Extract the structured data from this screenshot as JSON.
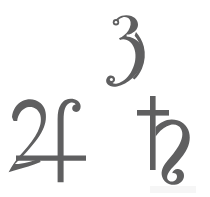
{
  "page": {
    "background_color": "#ffffff",
    "ink_color": "#5f5f60",
    "width": 210,
    "height": 197,
    "medium": "scanned print"
  },
  "symbols": [
    {
      "id": "three",
      "name": "numeral-three",
      "label": "3",
      "unicode": "3",
      "meaning": "numeral three",
      "position": {
        "x": 102,
        "y": 14,
        "width": 46,
        "height": 74
      },
      "color": "#5f5f60"
    },
    {
      "id": "jupiter",
      "name": "jupiter-symbol",
      "label": "♃",
      "unicode": "U+2643",
      "meaning": "Jupiter",
      "position": {
        "x": 8,
        "y": 98,
        "width": 84,
        "height": 86
      },
      "color": "#5f5f60"
    },
    {
      "id": "saturn",
      "name": "saturn-symbol",
      "label": "♄",
      "unicode": "U+2644",
      "meaning": "Saturn",
      "position": {
        "x": 136,
        "y": 94,
        "width": 64,
        "height": 92
      },
      "color": "#5f5f60"
    }
  ],
  "artifacts": {
    "bottom_edge_smudge": "faint scan smudge"
  }
}
